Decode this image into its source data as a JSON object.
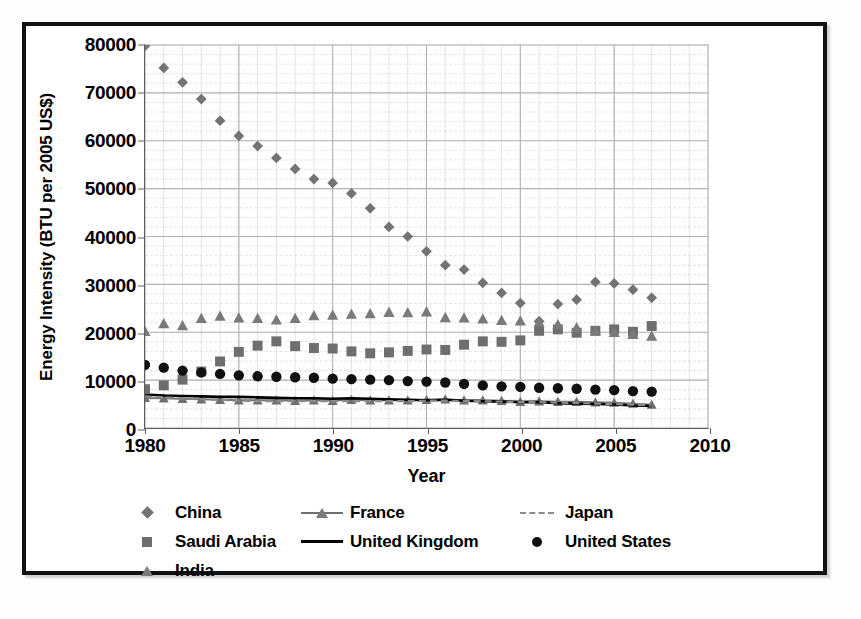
{
  "chart_data": {
    "type": "scatter",
    "title": "",
    "xlabel": "Year",
    "ylabel": "Energy Intensity (BTU per 2005 US$)",
    "xlim": [
      1980,
      2010
    ],
    "ylim": [
      0,
      80000
    ],
    "xticks": [
      "1980",
      "1985",
      "1990",
      "1995",
      "2000",
      "2005",
      "2010"
    ],
    "yticks": [
      "0",
      "10000",
      "20000",
      "30000",
      "40000",
      "50000",
      "60000",
      "70000",
      "80000"
    ],
    "x_major_step": 5,
    "x_minor_step": 1,
    "y_major_step": 10000,
    "y_minor_step": 2000,
    "grid": "major and minor gridlines, light gray",
    "legend_position": "bottom, three columns",
    "x": [
      1980,
      1981,
      1982,
      1983,
      1984,
      1985,
      1986,
      1987,
      1988,
      1989,
      1990,
      1991,
      1992,
      1993,
      1994,
      1995,
      1996,
      1997,
      1998,
      1999,
      2000,
      2001,
      2002,
      2003,
      2004,
      2005,
      2006,
      2007
    ],
    "series": [
      {
        "name": "China",
        "marker": "diamond",
        "color": "#737373",
        "style": "markers",
        "values": [
          79800,
          75200,
          72200,
          68700,
          64200,
          61000,
          58900,
          56400,
          54100,
          52000,
          51200,
          49000,
          45900,
          42000,
          40000,
          36900,
          34000,
          33100,
          30300,
          28200,
          26100,
          22300,
          25900,
          26800,
          30500,
          30200,
          28900,
          27200
        ]
      },
      {
        "name": "Saudi Arabia",
        "marker": "square",
        "color": "#6e6e6e",
        "style": "markers",
        "values": [
          8100,
          8900,
          10100,
          11800,
          13900,
          15900,
          17200,
          18100,
          17100,
          16700,
          16600,
          16000,
          15600,
          15800,
          16100,
          16400,
          16300,
          17400,
          18100,
          18000,
          18300,
          20300,
          20600,
          19900,
          20300,
          20600,
          20100,
          21300
        ]
      },
      {
        "name": "India",
        "marker": "triangle",
        "color": "#7a7a7a",
        "style": "markers",
        "values": [
          20200,
          21800,
          21400,
          22900,
          23400,
          23000,
          22900,
          22600,
          22900,
          23500,
          23600,
          23800,
          23900,
          24200,
          24100,
          24300,
          23100,
          23000,
          22800,
          22500,
          22400,
          22100,
          21600,
          21000,
          20300,
          20000,
          19600,
          19200
        ]
      },
      {
        "name": "United States",
        "marker": "circle",
        "color": "#101010",
        "style": "markers",
        "values": [
          13200,
          12600,
          12000,
          11600,
          11300,
          11000,
          10800,
          10700,
          10600,
          10500,
          10300,
          10200,
          10100,
          10000,
          9800,
          9700,
          9500,
          9200,
          8900,
          8700,
          8600,
          8400,
          8300,
          8200,
          8000,
          7900,
          7700,
          7600
        ]
      },
      {
        "name": "France",
        "marker": "triangle",
        "color": "#6f6f6f",
        "style": "line+markers",
        "values": [
          6300,
          6200,
          6100,
          6000,
          5900,
          5800,
          5800,
          5800,
          5700,
          5800,
          5700,
          5900,
          5800,
          5800,
          5800,
          5900,
          6000,
          5800,
          5800,
          5700,
          5500,
          5600,
          5500,
          5500,
          5400,
          5300,
          5100,
          4900
        ]
      },
      {
        "name": "United Kingdom",
        "marker": "none",
        "color": "#000000",
        "style": "solid line",
        "values": [
          7000,
          6800,
          6700,
          6600,
          6500,
          6500,
          6400,
          6300,
          6200,
          6200,
          6100,
          6200,
          6100,
          6000,
          5900,
          5800,
          5900,
          5700,
          5600,
          5500,
          5400,
          5400,
          5200,
          5100,
          5000,
          4900,
          4700,
          4600
        ]
      },
      {
        "name": "Japan",
        "marker": "none",
        "color": "#8a8a8a",
        "style": "dashed line",
        "values": [
          6600,
          6400,
          6200,
          6000,
          5900,
          5700,
          5600,
          5600,
          5600,
          5600,
          5600,
          5600,
          5600,
          5600,
          5600,
          5700,
          5700,
          5600,
          5600,
          5500,
          5400,
          5400,
          5300,
          5200,
          5100,
          5000,
          4900,
          4700
        ]
      }
    ]
  },
  "axis": {
    "x_title": "Year",
    "y_title": "Energy Intensity (BTU per 2005 US$)"
  },
  "legend": {
    "items": [
      {
        "label": "China",
        "key": "diamond"
      },
      {
        "label": "France",
        "key": "line-triangle"
      },
      {
        "label": "Japan",
        "key": "dashed-line"
      },
      {
        "label": "Saudi Arabia",
        "key": "square"
      },
      {
        "label": "United Kingdom",
        "key": "solid-line"
      },
      {
        "label": "United States",
        "key": "circle"
      },
      {
        "label": "India",
        "key": "triangle"
      }
    ]
  }
}
